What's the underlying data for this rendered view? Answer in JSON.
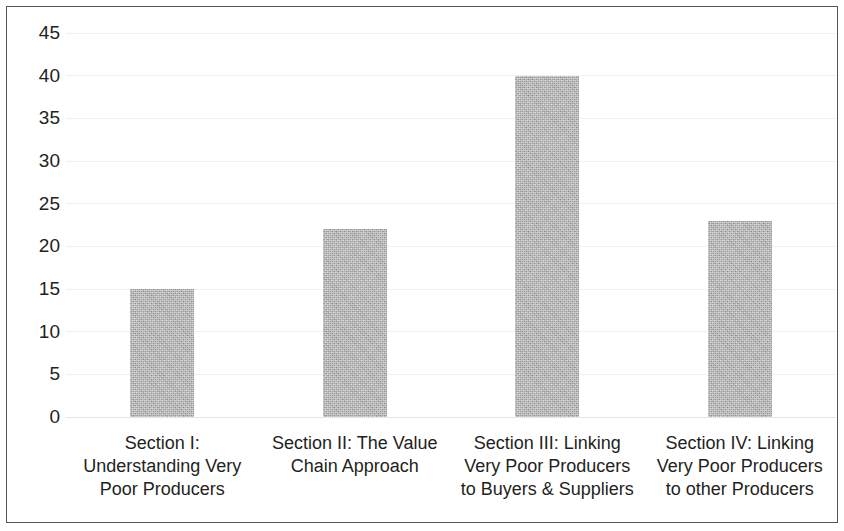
{
  "chart_data": {
    "type": "bar",
    "title": "",
    "subtitle": "",
    "xlabel": "",
    "ylabel": "",
    "categories": [
      "Section I: Understanding Very Poor Producers",
      "Section II: The Value Chain Approach",
      "Section III: Linking Very Poor Producers to Buyers & Suppliers",
      "Section IV: Linking Very Poor Producers to other Producers"
    ],
    "category_lines": [
      [
        "Section I:",
        "Understanding Very",
        "Poor Producers"
      ],
      [
        "Section II: The Value",
        "Chain Approach",
        ""
      ],
      [
        "Section III: Linking",
        "Very Poor Producers",
        "to Buyers & Suppliers"
      ],
      [
        "Section IV: Linking",
        "Very Poor Producers",
        "to other Producers"
      ]
    ],
    "values": [
      15,
      22,
      40,
      23
    ],
    "ylim": [
      0,
      45
    ],
    "ytick_labels": [
      "45",
      "40",
      "35",
      "30",
      "25",
      "20",
      "15",
      "10",
      "5",
      "0"
    ],
    "ytick_values": [
      45,
      40,
      35,
      30,
      25,
      20,
      15,
      10,
      5,
      0
    ],
    "ytick_step": 5,
    "grid": true,
    "grid_axis": "y",
    "legend": false,
    "legend_position": "none",
    "bar_color": "#a9a9a9",
    "grid_color": "#f0f0f0",
    "text_color": "#231f20",
    "border_color": "#555555",
    "background_color": "#ffffff"
  }
}
